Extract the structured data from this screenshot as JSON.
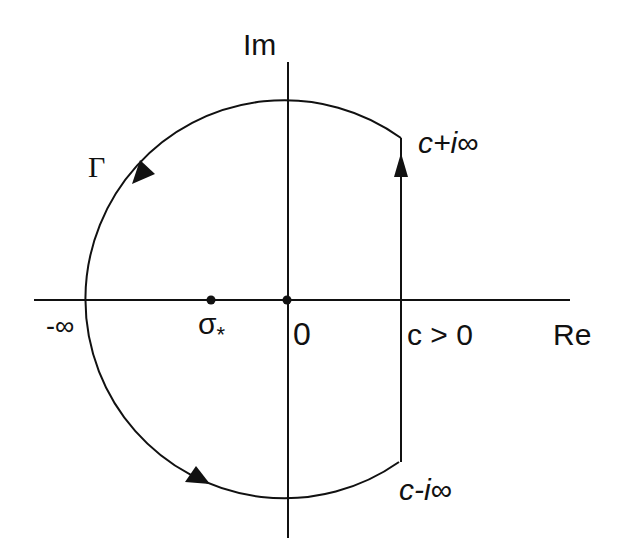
{
  "diagram": {
    "colors": {
      "stroke": "#111111",
      "background": "#ffffff"
    },
    "axes": {
      "real_label": "Re",
      "imag_label": "Im"
    },
    "labels": {
      "contour": "Γ",
      "minus_infinity": "-∞",
      "sigma_star_base": "σ",
      "sigma_star_sub": "*",
      "origin": "0",
      "c_condition": "c > 0",
      "c_plus": "c+",
      "c_plus_i": "i",
      "c_plus_inf": "∞",
      "c_minus": "c-",
      "c_minus_i": "i",
      "c_minus_inf": "∞"
    },
    "points": [
      {
        "name": "sigma_star",
        "x": 211,
        "y": 300
      },
      {
        "name": "origin",
        "x": 287,
        "y": 300
      }
    ],
    "contour": {
      "center": [
        288,
        300
      ],
      "radius": 199,
      "vertical_line_x": 401,
      "top_corner_y": 138,
      "bottom_corner_y": 462,
      "direction": "counterclockwise: up the line Re=c, then left along the large arc"
    }
  }
}
